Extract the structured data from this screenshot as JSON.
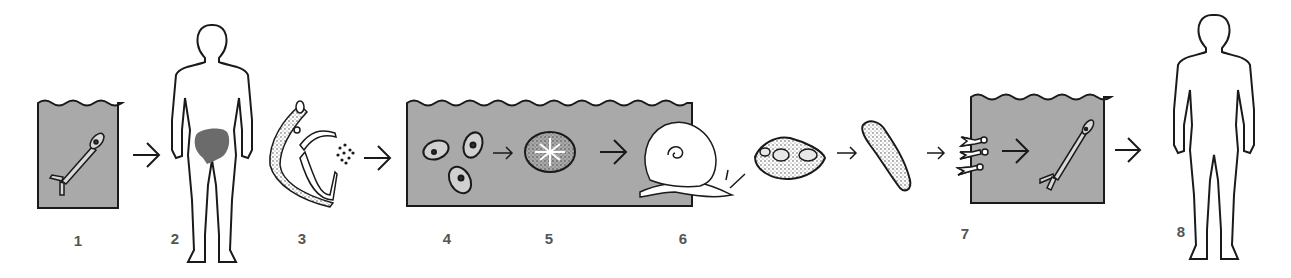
{
  "diagram": {
    "title": "",
    "colors": {
      "water": "#a9a9a9",
      "liver": "#6b6b6b",
      "ink": "#1a1a1a",
      "label": "#555555"
    },
    "stages": [
      {
        "number": "1",
        "depicts": "cercaria in water"
      },
      {
        "number": "2",
        "depicts": "human host with infected liver/intestine region"
      },
      {
        "number": "3",
        "depicts": "adult worm pair releasing eggs"
      },
      {
        "number": "4",
        "depicts": "eggs in water"
      },
      {
        "number": "5",
        "depicts": "miracidium"
      },
      {
        "number": "6",
        "depicts": "snail intermediate host"
      },
      {
        "number": "7",
        "depicts": "sporocysts and cercariae released into water"
      },
      {
        "number": "8",
        "depicts": "human host"
      }
    ]
  }
}
